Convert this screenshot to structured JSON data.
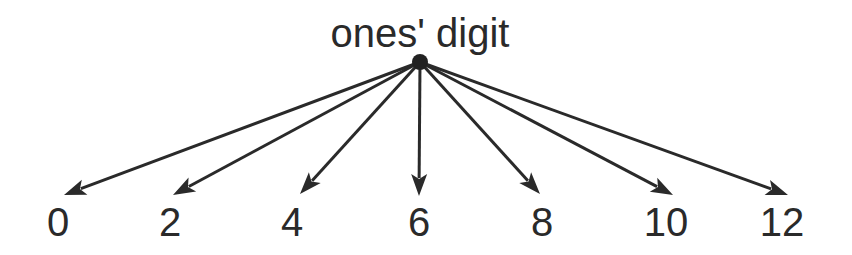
{
  "diagram": {
    "title": "ones' digit",
    "hub": {
      "x": 420,
      "y": 62,
      "r": 8
    },
    "colors": {
      "ink": "#2a2a2a",
      "background": "#ffffff"
    },
    "leaves": [
      {
        "label": "0",
        "tip_x": 64,
        "tip_y": 195,
        "label_x": 58
      },
      {
        "label": "2",
        "tip_x": 173,
        "tip_y": 195,
        "label_x": 170
      },
      {
        "label": "4",
        "tip_x": 300,
        "tip_y": 194,
        "label_x": 292
      },
      {
        "label": "6",
        "tip_x": 419,
        "tip_y": 196,
        "label_x": 419
      },
      {
        "label": "8",
        "tip_x": 540,
        "tip_y": 194,
        "label_x": 542
      },
      {
        "label": "10",
        "tip_x": 673,
        "tip_y": 195,
        "label_x": 666
      },
      {
        "label": "12",
        "tip_x": 788,
        "tip_y": 195,
        "label_x": 782
      }
    ]
  }
}
